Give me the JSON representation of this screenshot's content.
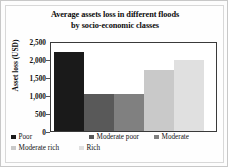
{
  "figure": {
    "title_line1": "Average assets loss in different floods",
    "title_line2": "by socio-economic classes",
    "ylabel": "Asset loss (USD)"
  },
  "chart_data": {
    "type": "bar",
    "title": "Average assets loss in different floods by socio-economic classes",
    "xlabel": "",
    "ylabel": "Asset loss (USD)",
    "ylim": [
      0,
      2500
    ],
    "ytick_labels": [
      "2,500",
      "2,000",
      "1,500",
      "1,000",
      "500",
      "0"
    ],
    "ytick_values": [
      2500,
      2000,
      1500,
      1000,
      500,
      0
    ],
    "grid": false,
    "legend_position": "bottom",
    "categories": [
      "Poor",
      "Moderate poor",
      "Moderate",
      "Moderate rich",
      "Rich"
    ],
    "values": [
      2200,
      1030,
      1030,
      1700,
      1970
    ],
    "colors": [
      "#1a1a1a",
      "#595959",
      "#808080",
      "#c9c9c9",
      "#e0e0e0"
    ],
    "series": [
      {
        "name": "Average asset loss",
        "values": [
          2200,
          1030,
          1030,
          1700,
          1970
        ]
      }
    ]
  },
  "legend": {
    "rows": [
      [
        {
          "label": "Poor",
          "color": "#1a1a1a"
        },
        {
          "label": "Moderate poor",
          "color": "#595959"
        },
        {
          "label": "Moderate",
          "color": "#808080"
        }
      ],
      [
        {
          "label": "Moderate rich",
          "color": "#c9c9c9"
        },
        {
          "label": "Rich",
          "color": "#e0e0e0"
        }
      ]
    ]
  }
}
